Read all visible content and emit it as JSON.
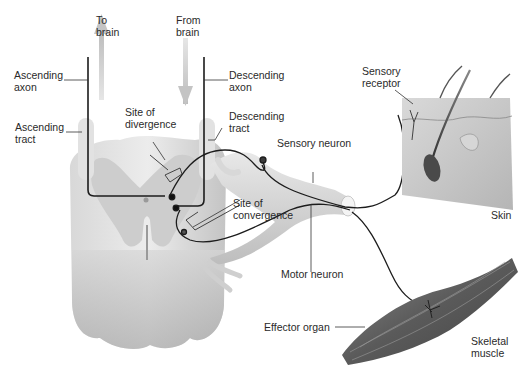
{
  "diagram": {
    "type": "neural pathway illustration",
    "labels": {
      "to_brain": "To\nbrain",
      "from_brain": "From\nbrain",
      "ascending_axon": "Ascending\naxon",
      "ascending_tract": "Ascending\ntract",
      "descending_axon": "Descending\naxon",
      "descending_tract": "Descending\ntract",
      "site_of_divergence": "Site of\ndivergence",
      "site_of_convergence": "Site of\nconvergence",
      "sensory_neuron": "Sensory neuron",
      "motor_neuron": "Motor neuron",
      "sensory_receptor": "Sensory\nreceptor",
      "skin": "Skin",
      "effector_organ": "Effector organ",
      "skeletal_muscle": "Skeletal\nmuscle"
    },
    "colors": {
      "spinal_cord_white": "#e4e4e4",
      "spinal_cord_gray": "#cfcfcf",
      "nerve": "#d3d3d3",
      "skin_block": "#c9c9c9",
      "muscle": "#6b6b6b",
      "axon_line": "#1c1c1c",
      "arrow": "#c8c8c8"
    }
  }
}
